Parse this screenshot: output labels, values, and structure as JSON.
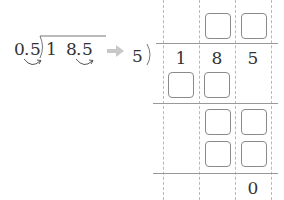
{
  "left_problem": {
    "divisor": "0.5",
    "divisor_int": "0",
    "divisor_frac": "5",
    "dividend_int_1": "1",
    "dividend_int_2": "8",
    "dividend_frac": "5",
    "decimal_point": "."
  },
  "arrow_icon": "right-arrow",
  "right_problem": {
    "divisor": "5",
    "dividend_digits": [
      "1",
      "8",
      "5"
    ],
    "final_remainder": "0"
  },
  "colors": {
    "text": "#333333",
    "arrow": "#c8c8c8",
    "box_border": "#8a8a8a",
    "grid_dashed": "#b8b8b8",
    "rule": "#999999"
  }
}
